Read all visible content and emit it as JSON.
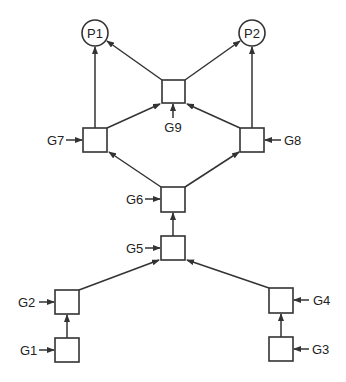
{
  "diagram": {
    "type": "directed-graph",
    "outputs": [
      {
        "id": "P1",
        "label": "P1"
      },
      {
        "id": "P2",
        "label": "P2"
      }
    ],
    "gates": [
      {
        "id": "G1",
        "label": "G1"
      },
      {
        "id": "G2",
        "label": "G2"
      },
      {
        "id": "G3",
        "label": "G3"
      },
      {
        "id": "G4",
        "label": "G4"
      },
      {
        "id": "G5",
        "label": "G5"
      },
      {
        "id": "G6",
        "label": "G6"
      },
      {
        "id": "G7",
        "label": "G7"
      },
      {
        "id": "G8",
        "label": "G8"
      },
      {
        "id": "G9",
        "label": "G9"
      }
    ],
    "edges": [
      [
        "G1",
        "G2"
      ],
      [
        "G3",
        "G4"
      ],
      [
        "G2",
        "G5"
      ],
      [
        "G4",
        "G5"
      ],
      [
        "G5",
        "G6"
      ],
      [
        "G6",
        "G7"
      ],
      [
        "G6",
        "G8"
      ],
      [
        "G7",
        "G9"
      ],
      [
        "G8",
        "G9"
      ],
      [
        "G7",
        "P1"
      ],
      [
        "G9",
        "P1"
      ],
      [
        "G9",
        "P2"
      ],
      [
        "G8",
        "P2"
      ]
    ]
  }
}
